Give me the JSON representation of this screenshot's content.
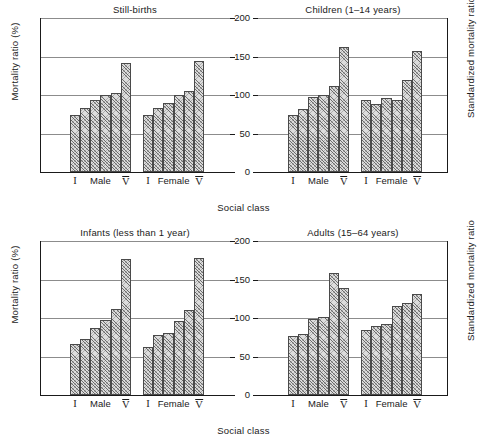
{
  "figure": {
    "ylabel_left": "Mortality ratio (%)",
    "ylabel_right": "Standardized mortality ratio",
    "xlabel": "Social class"
  },
  "axis": {
    "ticks": [
      {
        "label": "200",
        "value": 200
      },
      {
        "label": "150",
        "value": 150
      },
      {
        "label": "100",
        "value": 100
      },
      {
        "label": "50",
        "value": 50
      },
      {
        "label": "0",
        "value": 0
      }
    ],
    "ymin": 0,
    "ymax": 200
  },
  "group_labels": {
    "class_first": "I",
    "class_last": "V",
    "male": "Male",
    "female": "Female"
  },
  "chart_data": {
    "type": "bar",
    "xlabel": "Social class",
    "ylabel": "Mortality ratio (%)",
    "ylabel_secondary": "Standardized mortality ratio",
    "ylim": [
      0,
      200
    ],
    "yticks": [
      0,
      50,
      100,
      150,
      200
    ],
    "grid": true,
    "legend": "none",
    "categories": [
      "I",
      "II",
      "IIIN",
      "IIIM",
      "IV",
      "V"
    ],
    "panels": [
      {
        "title": "Still-births",
        "position": "top-left",
        "series": [
          {
            "name": "Male",
            "values": [
              74,
              83,
              93,
              100,
              103,
              142
            ]
          },
          {
            "name": "Female",
            "values": [
              74,
              83,
              90,
              100,
              105,
              144
            ]
          }
        ]
      },
      {
        "title": "Children (1–14 years)",
        "position": "top-right",
        "series": [
          {
            "name": "Male",
            "values": [
              74,
              82,
              97,
              100,
              112,
              162
            ]
          },
          {
            "name": "Female",
            "values": [
              94,
              88,
              96,
              93,
              120,
              157
            ]
          }
        ]
      },
      {
        "title": "Infants (less than 1 year)",
        "position": "bottom-left",
        "series": [
          {
            "name": "Male",
            "values": [
              66,
              73,
              87,
              97,
              112,
              176
            ]
          },
          {
            "name": "Female",
            "values": [
              62,
              78,
              80,
              96,
              110,
              178
            ]
          }
        ]
      },
      {
        "title": "Adults (15–64 years)",
        "position": "bottom-right",
        "series": [
          {
            "name": "Male",
            "values": [
              77,
              79,
              99,
              101,
              158,
              139
            ]
          },
          {
            "name": "Female",
            "values": [
              85,
              90,
              92,
              115,
              119,
              131
            ]
          }
        ]
      }
    ]
  }
}
